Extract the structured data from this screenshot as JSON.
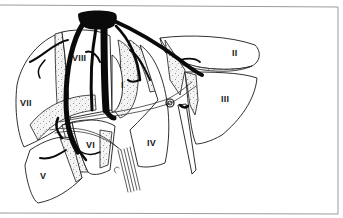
{
  "figure": {
    "background": "#ffffff",
    "ink_color": "#0a0a0a",
    "frame_color": "#9a9a9a"
  },
  "segments": [
    {
      "id": "I",
      "label": "I",
      "x": 121,
      "y": 88
    },
    {
      "id": "II",
      "label": "II",
      "x": 232,
      "y": 56
    },
    {
      "id": "III",
      "label": "III",
      "x": 221,
      "y": 102
    },
    {
      "id": "IV",
      "label": "IV",
      "x": 147,
      "y": 146
    },
    {
      "id": "V",
      "label": "V",
      "x": 86,
      "y": 148
    },
    {
      "id": "VI",
      "label": "VI",
      "x": 40,
      "y": 179
    },
    {
      "id": "VII",
      "label": "VII",
      "x": 20,
      "y": 106
    },
    {
      "id": "VIII",
      "label": "VIII",
      "x": 72,
      "y": 61
    }
  ],
  "structures": [
    {
      "name": "inferior-vena-cava",
      "kind": "vessel"
    },
    {
      "name": "right-hepatic-vein",
      "kind": "vessel"
    },
    {
      "name": "middle-hepatic-vein",
      "kind": "vessel"
    },
    {
      "name": "left-hepatic-vein",
      "kind": "vessel"
    },
    {
      "name": "portal-triad",
      "kind": "vessel-bundle"
    },
    {
      "name": "ligamentum-teres",
      "kind": "ligament"
    }
  ]
}
